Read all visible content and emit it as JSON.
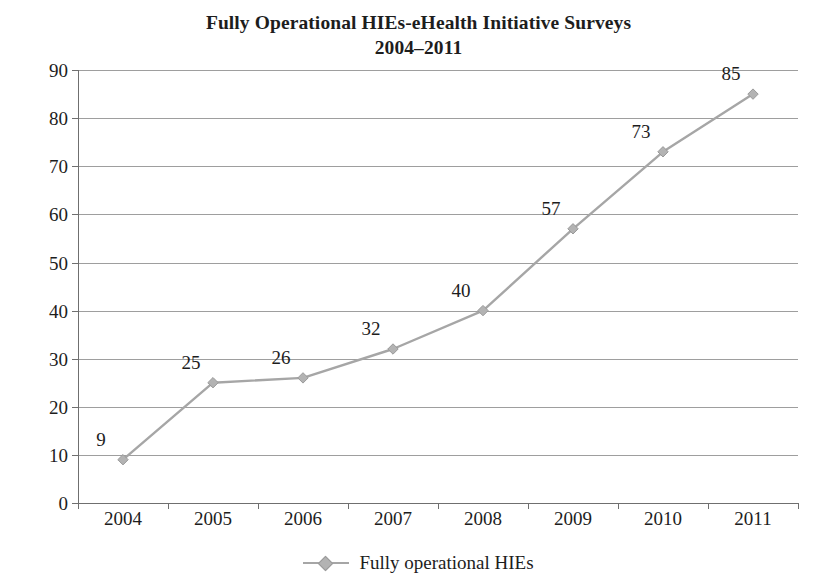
{
  "chart_data": {
    "type": "line",
    "title": "Fully Operational HIEs-eHealth Initiative Surveys",
    "subtitle": "2004–2011",
    "xlabel": "",
    "ylabel": "",
    "categories": [
      "2004",
      "2005",
      "2006",
      "2007",
      "2008",
      "2009",
      "2010",
      "2011"
    ],
    "series": [
      {
        "name": "Fully operational HIEs",
        "values": [
          9,
          25,
          26,
          32,
          40,
          57,
          73,
          85
        ],
        "color": "#a6a6a6",
        "marker": "diamond",
        "marker_color": "#b3b3b3",
        "show_data_labels": true
      }
    ],
    "ylim": [
      0,
      90
    ],
    "ytick_step": 10,
    "yticks": [
      "0",
      "10",
      "20",
      "30",
      "40",
      "50",
      "60",
      "70",
      "80",
      "90"
    ],
    "data_labels": [
      "9",
      "25",
      "26",
      "32",
      "40",
      "57",
      "73",
      "85"
    ],
    "grid": "horizontal",
    "grid_color": "#9e9e9e",
    "legend_position": "bottom",
    "legend_entries": [
      "Fully operational HIEs"
    ],
    "background_color": "#ffffff",
    "axis_color": "#6f6f6f",
    "text_color": "#1d1d1d"
  },
  "legend": {
    "label": "Fully operational HIEs"
  }
}
